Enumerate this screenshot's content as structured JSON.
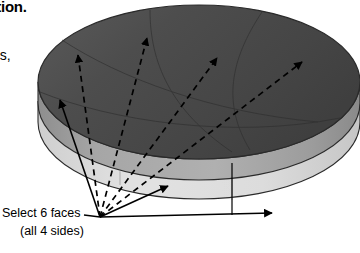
{
  "figure": {
    "title_fragment": "ction.",
    "body_fragment": "ns,",
    "callout": {
      "line1": "Select 6 faces",
      "line2": "(all 4 sides)"
    },
    "shape": {
      "name": "cylinder",
      "description": "shaded 3D cylinder (puck) in isometric view with segmented top face",
      "top_face_color": "#4b4b4b",
      "side_face_color": "#9e9e9e",
      "bottom_band_color": "#dadada",
      "outline_color": "#2a2a2a",
      "segment_line_color": "#3a3a3a"
    },
    "annotations": {
      "dashed_arrow_count": 4,
      "solid_arrow_count": 3,
      "leader_color": "#000000",
      "convergence_point": "100,217"
    }
  }
}
